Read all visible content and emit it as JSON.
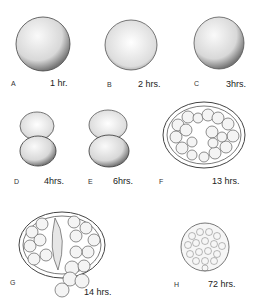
{
  "figures": [
    {
      "letter": "A",
      "time": "1 hr."
    },
    {
      "letter": "B",
      "time": "2 hrs."
    },
    {
      "letter": "C",
      "time": "3hrs."
    },
    {
      "letter": "D",
      "time": "4hrs."
    },
    {
      "letter": "E",
      "time": "6hrs."
    },
    {
      "letter": "F",
      "time": "13 hrs."
    },
    {
      "letter": "G",
      "time": "14 hrs."
    },
    {
      "letter": "H",
      "time": "72 hrs."
    }
  ],
  "colors": {
    "ink": "#222222",
    "fill": "#f2f2f2",
    "background": "#ffffff"
  }
}
